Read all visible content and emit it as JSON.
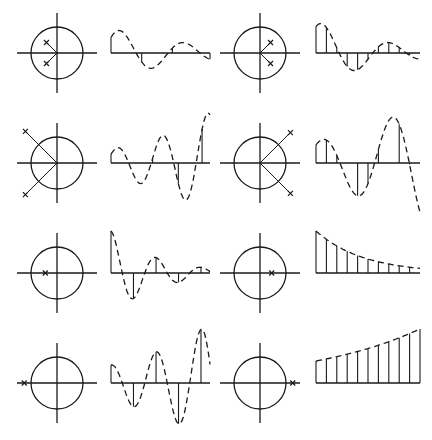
{
  "figure": {
    "stroke_color": "#1a1a1a",
    "background": "#ffffff",
    "panels": [
      {
        "row": 0,
        "col": 0,
        "pole_marker": "x",
        "poles": [
          [
            -0.45,
            0.45
          ],
          [
            -0.45,
            -0.45
          ]
        ],
        "response": "damped oscillation, low frequency, samples shown sparse",
        "envelope": "decaying",
        "stems": "sparse"
      },
      {
        "row": 0,
        "col": 1,
        "pole_marker": "x",
        "poles": [
          [
            0.45,
            0.45
          ],
          [
            0.45,
            -0.45
          ]
        ],
        "response": "decaying oscillation with dense samples",
        "envelope": "decaying",
        "stems": "dense"
      },
      {
        "row": 1,
        "col": 0,
        "pole_marker": "x",
        "poles": [
          [
            -1.35,
            1.35
          ],
          [
            -1.35,
            -1.35
          ]
        ],
        "response": "growing oscillation, high frequency",
        "envelope": "growing",
        "stems": "sparse"
      },
      {
        "row": 1,
        "col": 1,
        "pole_marker": "x",
        "poles": [
          [
            1.3,
            1.3
          ],
          [
            1.3,
            -1.3
          ]
        ],
        "response": "growing oscillation, low frequency",
        "envelope": "growing",
        "stems": "dense"
      },
      {
        "row": 2,
        "col": 0,
        "pole_marker": "x",
        "poles": [
          [
            -0.5,
            0
          ]
        ],
        "response": "alternating decaying sequence",
        "envelope": "decaying",
        "stems": "alternating"
      },
      {
        "row": 2,
        "col": 1,
        "pole_marker": "x",
        "poles": [
          [
            0.5,
            0
          ]
        ],
        "response": "monotonic decaying sequence",
        "envelope": "decaying",
        "stems": "monotonic"
      },
      {
        "row": 3,
        "col": 0,
        "pole_marker": "x",
        "poles": [
          [
            -1.4,
            0
          ]
        ],
        "response": "alternating growing sequence",
        "envelope": "growing",
        "stems": "alternating"
      },
      {
        "row": 3,
        "col": 1,
        "pole_marker": "x",
        "poles": [
          [
            1.4,
            0
          ]
        ],
        "response": "monotonic growing sequence",
        "envelope": "growing",
        "stems": "monotonic"
      }
    ]
  }
}
